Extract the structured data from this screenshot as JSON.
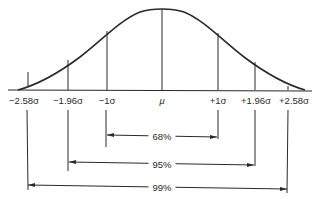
{
  "diagram": {
    "colors": {
      "line": "#2a2a2a",
      "background": "#ffffff"
    },
    "mean_label": "μ",
    "axis_labels": [
      {
        "id": "neg258",
        "text": "−2.58σ",
        "x": 28
      },
      {
        "id": "neg196",
        "text": "−1.96σ",
        "x": 68
      },
      {
        "id": "neg1",
        "text": "−1σ",
        "x": 107
      },
      {
        "id": "mu",
        "text": "μ",
        "x": 162
      },
      {
        "id": "pos1",
        "text": "+1σ",
        "x": 218
      },
      {
        "id": "pos196",
        "text": "+1.96σ",
        "x": 255
      },
      {
        "id": "pos258",
        "text": "+2.58σ",
        "x": 288
      }
    ],
    "intervals": [
      {
        "id": "68",
        "label": "68%",
        "from": "−1σ",
        "to": "+1σ"
      },
      {
        "id": "95",
        "label": "95%",
        "from": "−1.96σ",
        "to": "+1.96σ"
      },
      {
        "id": "99",
        "label": "99%",
        "from": "−2.58σ",
        "to": "+2.58σ"
      }
    ]
  }
}
